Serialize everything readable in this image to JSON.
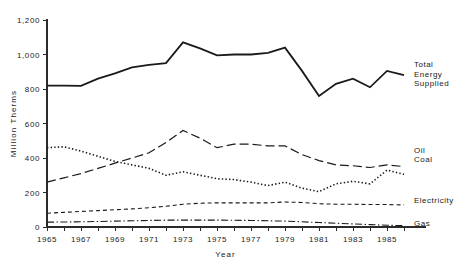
{
  "chart_data": {
    "type": "line",
    "title": "",
    "xlabel": "Year",
    "ylabel": "Million Therms",
    "xlim": [
      1965,
      1986
    ],
    "ylim": [
      0,
      1200
    ],
    "grid": false,
    "legend_position": "right-inline-labels",
    "x": [
      1965,
      1966,
      1967,
      1968,
      1969,
      1970,
      1971,
      1972,
      1973,
      1974,
      1975,
      1976,
      1977,
      1978,
      1979,
      1980,
      1981,
      1982,
      1983,
      1984,
      1985,
      1986
    ],
    "xticks": [
      1965,
      1967,
      1969,
      1971,
      1973,
      1975,
      1977,
      1979,
      1981,
      1983,
      1985
    ],
    "xtick_labels": [
      "1965",
      "1967",
      "1969",
      "1971",
      "1973",
      "1975",
      "1977",
      "1979",
      "1981",
      "1983",
      "1985"
    ],
    "yticks": [
      0,
      200,
      400,
      600,
      800,
      1000,
      1200
    ],
    "ytick_labels": [
      "0",
      "200",
      "400",
      "600",
      "800",
      "1,000",
      "1,200"
    ],
    "series": [
      {
        "name": "Total Energy Supplied",
        "label": "Total\nEnergy\nSupplied",
        "label_lines": [
          "Total",
          "Energy",
          "Supplied"
        ],
        "style": "solid",
        "color": "#1a1a1a",
        "width": 1.8,
        "values": [
          820,
          820,
          818,
          860,
          890,
          925,
          940,
          950,
          1070,
          1035,
          995,
          1000,
          1000,
          1010,
          1040,
          905,
          760,
          830,
          860,
          810,
          905,
          880
        ]
      },
      {
        "name": "Oil",
        "label": "Oil",
        "style": "long-dash",
        "color": "#1a1a1a",
        "width": 1.2,
        "values": [
          260,
          285,
          310,
          340,
          370,
          400,
          430,
          490,
          560,
          515,
          460,
          480,
          480,
          470,
          470,
          420,
          385,
          360,
          355,
          345,
          360,
          350
        ]
      },
      {
        "name": "Coal",
        "label": "Coal",
        "style": "dotted",
        "color": "#1a1a1a",
        "width": 1.6,
        "values": [
          460,
          465,
          440,
          410,
          380,
          360,
          340,
          300,
          320,
          300,
          280,
          275,
          260,
          240,
          260,
          225,
          205,
          250,
          265,
          250,
          330,
          305
        ]
      },
      {
        "name": "Electricity",
        "label": "Electricity",
        "style": "short-dash",
        "color": "#1a1a1a",
        "width": 1.1,
        "values": [
          80,
          85,
          90,
          95,
          100,
          105,
          112,
          120,
          132,
          138,
          140,
          140,
          140,
          140,
          145,
          142,
          135,
          132,
          132,
          130,
          130,
          128
        ]
      },
      {
        "name": "Gas",
        "label": "Gas",
        "style": "dash-dot",
        "color": "#1a1a1a",
        "width": 1.1,
        "values": [
          28,
          29,
          30,
          32,
          34,
          36,
          38,
          40,
          40,
          40,
          40,
          39,
          38,
          36,
          34,
          30,
          26,
          22,
          18,
          14,
          10,
          8
        ]
      }
    ]
  },
  "axes": {
    "y_title": "Million Therms",
    "x_title": "Year"
  }
}
